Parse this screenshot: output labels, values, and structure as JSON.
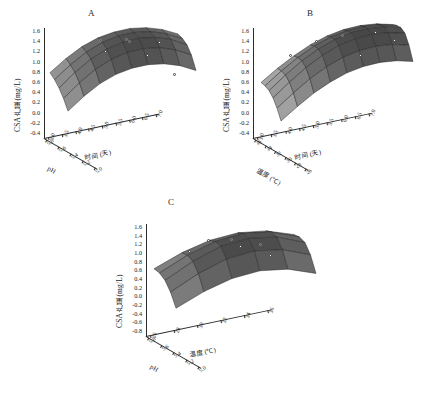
{
  "figure": {
    "caption_partial": "",
    "panels": [
      "A",
      "B",
      "C"
    ]
  },
  "chart_data": [
    {
      "id": "A",
      "type": "surface3d",
      "panel_label": "A",
      "title": "",
      "zlabel": "CSA产量 (mg/L)",
      "zticks": [
        "1.6",
        "1.4",
        "1.2",
        "1.0",
        "0.8",
        "0.6",
        "0.4",
        "0.2",
        "0.0",
        "-0.2",
        "-0.4"
      ],
      "zlim": [
        -0.4,
        1.6
      ],
      "xlabel": "pH",
      "xticks": [
        "5.8",
        "5.6",
        "5.4",
        "5.2",
        "5.0"
      ],
      "xlim": [
        5.0,
        5.8
      ],
      "ylabel": "时间 (天)",
      "yticks": [
        "3.0",
        "3.5",
        "4.0",
        "4.5",
        "5.0",
        "5.5",
        "6.0",
        "6.5",
        "7.0"
      ],
      "ylim": [
        3.0,
        7.0
      ],
      "grid": true,
      "legend": "none",
      "surface_shape": "ridge-saddle",
      "z_matrix": [
        [
          0.32,
          0.62,
          0.86,
          1.02,
          1.1,
          1.12,
          1.07,
          0.95,
          0.76
        ],
        [
          0.4,
          0.72,
          0.98,
          1.16,
          1.26,
          1.28,
          1.23,
          1.1,
          0.9
        ],
        [
          0.44,
          0.78,
          1.06,
          1.25,
          1.36,
          1.39,
          1.34,
          1.21,
          1.0
        ],
        [
          0.43,
          0.77,
          1.05,
          1.24,
          1.35,
          1.38,
          1.33,
          1.2,
          0.99
        ],
        [
          0.36,
          0.68,
          0.94,
          1.11,
          1.2,
          1.22,
          1.17,
          1.05,
          0.85
        ]
      ],
      "data_points": [
        {
          "x": 5.55,
          "y": 4.4,
          "z": 1.28,
          "style": "open"
        },
        {
          "x": 5.4,
          "y": 5.1,
          "z": 1.41,
          "style": "open"
        },
        {
          "x": 5.4,
          "y": 5.2,
          "z": 1.36,
          "style": "open"
        },
        {
          "x": 5.22,
          "y": 6.0,
          "z": 1.45,
          "style": "filled"
        },
        {
          "x": 5.72,
          "y": 3.4,
          "z": 0.58,
          "style": "open"
        },
        {
          "x": 5.6,
          "y": 4.6,
          "z": 0.92,
          "style": "filled"
        },
        {
          "x": 5.3,
          "y": 5.7,
          "z": 1.05,
          "style": "filled"
        },
        {
          "x": 5.1,
          "y": 6.4,
          "z": 0.7,
          "style": "filled"
        }
      ]
    },
    {
      "id": "B",
      "type": "surface3d",
      "panel_label": "B",
      "title": "",
      "zlabel": "CSA产量 (mg/L)",
      "zticks": [
        "1.6",
        "1.4",
        "1.2",
        "1.0",
        "0.8",
        "0.6",
        "0.4",
        "0.2",
        "0.0",
        "-0.2",
        "-0.4"
      ],
      "zlim": [
        -0.4,
        1.6
      ],
      "xlabel": "温度 (℃)",
      "xticks": [
        "36",
        "34",
        "32",
        "30",
        "28",
        "26"
      ],
      "xlim": [
        26,
        36
      ],
      "ylabel": "时间 (天)",
      "yticks": [
        "3.0",
        "3.5",
        "4.0",
        "4.5",
        "5.0",
        "5.5",
        "6.0",
        "6.5",
        "7.0"
      ],
      "ylim": [
        3.0,
        7.0
      ],
      "grid": true,
      "legend": "none",
      "surface_shape": "rising-ridge",
      "z_matrix": [
        [
          0.1,
          0.38,
          0.62,
          0.82,
          0.96,
          1.04,
          1.06,
          1.02,
          0.92
        ],
        [
          0.22,
          0.52,
          0.78,
          0.99,
          1.14,
          1.22,
          1.24,
          1.2,
          1.1
        ],
        [
          0.3,
          0.62,
          0.9,
          1.12,
          1.28,
          1.37,
          1.39,
          1.35,
          1.25
        ],
        [
          0.32,
          0.64,
          0.93,
          1.16,
          1.33,
          1.42,
          1.45,
          1.41,
          1.31
        ],
        [
          0.26,
          0.57,
          0.85,
          1.07,
          1.23,
          1.32,
          1.35,
          1.31,
          1.21
        ],
        [
          0.14,
          0.43,
          0.69,
          0.89,
          1.04,
          1.12,
          1.14,
          1.1,
          1.0
        ]
      ],
      "data_points": [
        {
          "x": 31.5,
          "y": 5.2,
          "z": 1.4,
          "style": "open"
        },
        {
          "x": 30.0,
          "y": 6.1,
          "z": 1.47,
          "style": "filled"
        },
        {
          "x": 28.6,
          "y": 6.6,
          "z": 1.33,
          "style": "filled"
        },
        {
          "x": 33.2,
          "y": 4.5,
          "z": 1.18,
          "style": "filled"
        },
        {
          "x": 34.4,
          "y": 3.8,
          "z": 0.82,
          "style": "filled"
        },
        {
          "x": 29.2,
          "y": 5.6,
          "z": 1.05,
          "style": "filled"
        }
      ]
    },
    {
      "id": "C",
      "type": "surface3d",
      "panel_label": "C",
      "title": "",
      "zlabel": "CSA产量 (mg/L)",
      "zticks": [
        "1.6",
        "1.4",
        "1.2",
        "1.0",
        "0.8",
        "0.6",
        "0.4",
        "0.2",
        "0.0",
        "-0.2",
        "-0.4",
        "-0.6",
        "-0.8"
      ],
      "zlim": [
        -0.8,
        1.6
      ],
      "xlabel": "pH",
      "xticks": [
        "5.8",
        "5.6",
        "5.4",
        "5.2",
        "5.0"
      ],
      "xlim": [
        5.0,
        5.8
      ],
      "ylabel": "温度 (℃)",
      "yticks": [
        "26",
        "28",
        "30",
        "32",
        "34",
        "36"
      ],
      "ylim": [
        26,
        36
      ],
      "grid": true,
      "legend": "none",
      "surface_shape": "dome",
      "z_matrix": [
        [
          0.28,
          0.62,
          0.84,
          0.9,
          0.78,
          0.48
        ],
        [
          0.48,
          0.88,
          1.14,
          1.22,
          1.08,
          0.74
        ],
        [
          0.58,
          1.02,
          1.32,
          1.4,
          1.26,
          0.9
        ],
        [
          0.54,
          0.96,
          1.25,
          1.33,
          1.19,
          0.84
        ],
        [
          0.36,
          0.72,
          0.96,
          1.03,
          0.9,
          0.58
        ]
      ],
      "data_points": [
        {
          "x": 5.42,
          "y": 30.8,
          "z": 1.44,
          "style": "open"
        },
        {
          "x": 5.28,
          "y": 32.6,
          "z": 1.36,
          "style": "open"
        },
        {
          "x": 5.55,
          "y": 29.4,
          "z": 1.3,
          "style": "filled"
        },
        {
          "x": 5.4,
          "y": 31.4,
          "z": 1.18,
          "style": "filled"
        },
        {
          "x": 5.24,
          "y": 33.2,
          "z": 1.02,
          "style": "filled"
        },
        {
          "x": 5.64,
          "y": 28.2,
          "z": 0.92,
          "style": "filled"
        }
      ]
    }
  ],
  "style": {
    "surface_color_dark": "#3a3a3a",
    "surface_color_light": "#d8d8d8",
    "mesh_line_color": "#1f1f1f",
    "axis_color": "#2b2b2b",
    "marker_fill": "#ffffff",
    "background": "#ffffff"
  }
}
